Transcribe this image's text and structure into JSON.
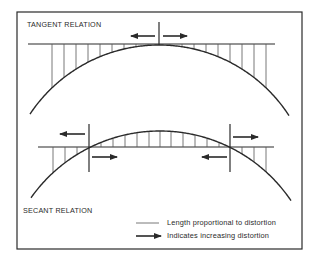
{
  "diagram": {
    "frame": {
      "x": 17,
      "y": 12,
      "w": 285,
      "h": 237,
      "stroke": "#2a2a2a"
    },
    "colors": {
      "line": "#2a2a2a",
      "tick": "#555555",
      "background": "#ffffff"
    },
    "tangent": {
      "title": "TANGENT RELATION",
      "title_pos": {
        "x": 27,
        "y": 20
      },
      "line": {
        "x1": 28,
        "x2": 275,
        "y": 44
      },
      "arc": {
        "cx": 159,
        "apex_y": 45,
        "r": 155,
        "x_start": 30,
        "x_end": 289
      },
      "ticks_x": [
        52,
        64,
        76,
        88,
        100,
        112,
        124,
        136,
        148,
        170,
        182,
        194,
        206,
        218,
        230,
        242,
        254,
        266
      ],
      "marker": {
        "x": 159,
        "y1": 22,
        "y2": 45
      },
      "arrows": [
        {
          "x1": 155,
          "x2": 131,
          "y": 36,
          "direction": "left"
        },
        {
          "x1": 163,
          "x2": 187,
          "y": 36,
          "direction": "right"
        }
      ]
    },
    "secant": {
      "title": "SECANT RELATION",
      "title_pos": {
        "x": 23,
        "y": 206
      },
      "line": {
        "x1": 38,
        "x2": 274,
        "y": 147
      },
      "arc": {
        "cx": 160,
        "apex_y": 131,
        "r": 158,
        "x_start": 31,
        "x_end": 291
      },
      "ticks_x": [
        53,
        65,
        77,
        101,
        113,
        125,
        137,
        149,
        160,
        171,
        183,
        195,
        207,
        219,
        242,
        254,
        266
      ],
      "markers": [
        {
          "x": 89,
          "y1": 124,
          "y2": 172
        },
        {
          "x": 230,
          "y1": 124,
          "y2": 172
        }
      ],
      "arrows": [
        {
          "x1": 85,
          "x2": 60,
          "y": 134,
          "direction": "left"
        },
        {
          "x1": 92,
          "x2": 117,
          "y": 157,
          "direction": "right"
        },
        {
          "x1": 233,
          "x2": 258,
          "y": 137,
          "direction": "right"
        },
        {
          "x1": 227,
          "x2": 202,
          "y": 157,
          "direction": "left"
        }
      ]
    },
    "legend": {
      "items": [
        {
          "symbol": "thin-line",
          "label": "Length proportional to distortion",
          "sym_x1": 136,
          "sym_x2": 159,
          "y": 223,
          "text_x": 167
        },
        {
          "symbol": "arrow",
          "label": "Indicates increasing distortion",
          "sym_x1": 136,
          "sym_x2": 161,
          "y": 236,
          "text_x": 167
        }
      ]
    }
  }
}
